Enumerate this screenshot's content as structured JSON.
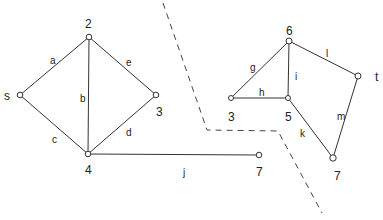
{
  "diagram": {
    "type": "graph-cut",
    "left_graph": {
      "nodes": [
        {
          "id": "s",
          "label": "s"
        },
        {
          "id": "2",
          "label": "2"
        },
        {
          "id": "3",
          "label": "3"
        },
        {
          "id": "4",
          "label": "4"
        },
        {
          "id": "7a",
          "label": "7"
        }
      ],
      "edges": [
        {
          "label": "a",
          "from": "s",
          "to": "2"
        },
        {
          "label": "b",
          "from": "2",
          "to": "4"
        },
        {
          "label": "c",
          "from": "s",
          "to": "4"
        },
        {
          "label": "d",
          "from": "4",
          "to": "3"
        },
        {
          "label": "e",
          "from": "2",
          "to": "3"
        },
        {
          "label": "j",
          "from": "4",
          "to": "7a"
        }
      ]
    },
    "right_graph": {
      "nodes": [
        {
          "id": "6",
          "label": "6"
        },
        {
          "id": "t",
          "label": "t"
        },
        {
          "id": "3b",
          "label": "3"
        },
        {
          "id": "5",
          "label": "5"
        },
        {
          "id": "7b",
          "label": "7"
        }
      ],
      "edges": [
        {
          "label": "g",
          "from": "3b",
          "to": "6"
        },
        {
          "label": "h",
          "from": "3b",
          "to": "5"
        },
        {
          "label": "i",
          "from": "6",
          "to": "5"
        },
        {
          "label": "l",
          "from": "6",
          "to": "t"
        },
        {
          "label": "k",
          "from": "5",
          "to": "7b"
        },
        {
          "label": "m",
          "from": "t",
          "to": "7b"
        }
      ]
    },
    "cut_line": "dashed"
  }
}
